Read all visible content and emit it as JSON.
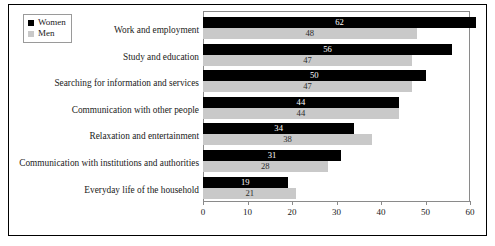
{
  "chart_data": {
    "type": "bar",
    "orientation": "horizontal",
    "title": "",
    "xlabel": "",
    "ylabel": "",
    "xlim": [
      0,
      60
    ],
    "grid": false,
    "legend_position": "top-left",
    "categories": [
      "Work and employment",
      "Study and education",
      "Searching for information and services",
      "Communication with other people",
      "Relaxation and entertainment",
      "Communication with institutions and authorities",
      "Everyday life of the household"
    ],
    "series": [
      {
        "name": "Women",
        "color": "#000000",
        "values": [
          62,
          56,
          50,
          44,
          34,
          31,
          19
        ]
      },
      {
        "name": "Men",
        "color": "#c9c9c9",
        "values": [
          48,
          47,
          47,
          44,
          38,
          28,
          21
        ]
      }
    ],
    "xticks": [
      0,
      10,
      20,
      30,
      40,
      50,
      60
    ],
    "xtick_labels": [
      "0",
      "10",
      "20",
      "30",
      "40",
      "50",
      "60"
    ]
  },
  "legend": {
    "items": [
      {
        "label": "Women",
        "color": "#000000"
      },
      {
        "label": "Men",
        "color": "#c9c9c9"
      }
    ]
  }
}
